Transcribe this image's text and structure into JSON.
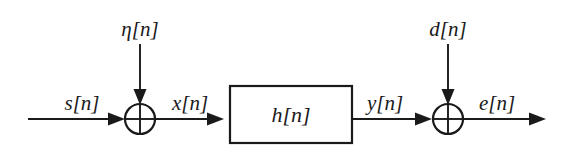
{
  "diagram": {
    "background_color": "#ffffff",
    "line_color": "#1a1a1a",
    "labels": {
      "input_signal": "s[n]",
      "noise_input": "η[n]",
      "filter_input": "x[n]",
      "filter_block": "h[n]",
      "filter_output": "y[n]",
      "desired_input": "d[n]",
      "error_output": "e[n]"
    },
    "nodes": [
      {
        "name": "left-summing-junction",
        "symbol": "⊕",
        "cx": 140,
        "cy": 119,
        "r": 15
      },
      {
        "name": "right-summing-junction",
        "symbol": "⊕",
        "cx": 448,
        "cy": 119,
        "r": 15
      }
    ],
    "blocks": [
      {
        "name": "filter-block",
        "label": "h[n]",
        "x": 230,
        "y": 86,
        "width": 122,
        "height": 57
      }
    ]
  }
}
